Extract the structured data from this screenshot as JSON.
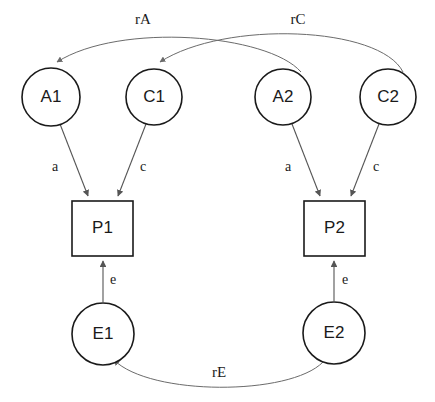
{
  "diagram": {
    "type": "path-diagram",
    "title": "",
    "background_color": "#ffffff",
    "node_stroke_color": "#1a1a1a",
    "edge_color": "#555555",
    "curve_color": "#6b6b6b",
    "nodes": [
      {
        "id": "A1",
        "label": "A1",
        "shape": "circle",
        "cx": 51,
        "cy": 97,
        "r": 29
      },
      {
        "id": "C1",
        "label": "C1",
        "shape": "circle",
        "cx": 154,
        "cy": 97,
        "r": 28
      },
      {
        "id": "A2",
        "label": "A2",
        "shape": "circle",
        "cx": 283,
        "cy": 97,
        "r": 28
      },
      {
        "id": "C2",
        "label": "C2",
        "shape": "circle",
        "cx": 388,
        "cy": 97,
        "r": 28
      },
      {
        "id": "P1",
        "label": "P1",
        "shape": "rect",
        "x": 72,
        "y": 201,
        "w": 61,
        "h": 55
      },
      {
        "id": "P2",
        "label": "P2",
        "shape": "rect",
        "x": 304,
        "y": 201,
        "w": 61,
        "h": 55
      },
      {
        "id": "E1",
        "label": "E1",
        "shape": "circle",
        "cx": 103,
        "cy": 334,
        "r": 31
      },
      {
        "id": "E2",
        "label": "E2",
        "shape": "circle",
        "cx": 334,
        "cy": 333,
        "r": 31
      }
    ],
    "edges": [
      {
        "id": "a1-p1",
        "from": "A1",
        "to": "P1",
        "label": "a",
        "label_x": 55,
        "label_y": 168
      },
      {
        "id": "c1-p1",
        "from": "C1",
        "to": "P1",
        "label": "c",
        "label_x": 143,
        "label_y": 168
      },
      {
        "id": "a2-p2",
        "from": "A2",
        "to": "P2",
        "label": "a",
        "label_x": 288,
        "label_y": 168
      },
      {
        "id": "c2-p2",
        "from": "C2",
        "to": "P2",
        "label": "c",
        "label_x": 376,
        "label_y": 168
      },
      {
        "id": "e1-p1",
        "from": "E1",
        "to": "P1",
        "label": "e",
        "label_x": 113,
        "label_y": 281
      },
      {
        "id": "e2-p2",
        "from": "E2",
        "to": "P2",
        "label": "e",
        "label_x": 345,
        "label_y": 281
      }
    ],
    "correlations": [
      {
        "id": "rA",
        "label": "rA",
        "from": "A2",
        "to": "A1",
        "label_x": 143,
        "label_y": 21
      },
      {
        "id": "rC",
        "label": "rC",
        "from": "C2",
        "to": "C1",
        "label_x": 298,
        "label_y": 21
      },
      {
        "id": "rE",
        "label": "rE",
        "from": "E2",
        "to": "E1",
        "label_x": 219,
        "label_y": 374
      }
    ]
  }
}
